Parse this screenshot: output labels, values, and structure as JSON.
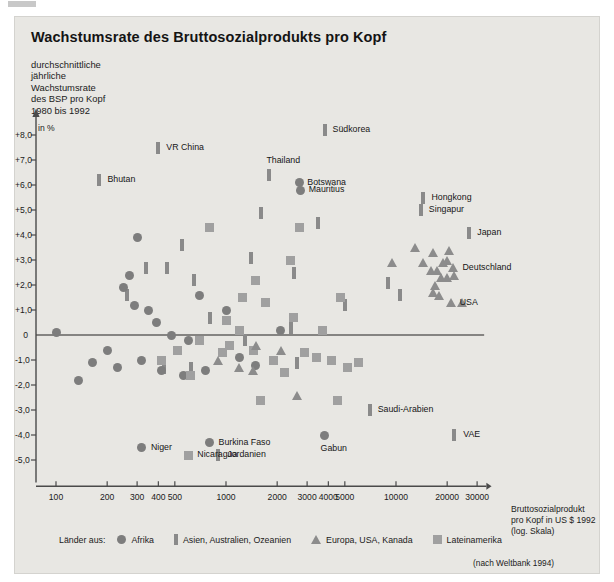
{
  "header": {
    "title": "Wachstumsrate des Bruttosozialprodukts pro Kopf",
    "subtitle": "durchschnittliche\njährliche\nWachstumsrate\ndes BSP pro Kopf\n1980 bis 1992"
  },
  "source_note": "(nach Weltbank 1994)",
  "legend": {
    "title": "Länder aus:",
    "items": [
      {
        "marker": "circle",
        "label": "Afrika",
        "color": "#7d7d7d"
      },
      {
        "marker": "bar",
        "label": "Asien, Australien, Ozeanien",
        "color": "#8a8a8a"
      },
      {
        "marker": "triangle",
        "label": "Europa, USA, Kanada",
        "color": "#8c8c8c"
      },
      {
        "marker": "square",
        "label": "Lateinamerika",
        "color": "#a0a0a0"
      }
    ]
  },
  "chart_data": {
    "type": "scatter",
    "title": "Wachstumsrate des Bruttosozialprodukts pro Kopf",
    "xlabel": "Bruttosozialprodukt\npro Kopf in US $ 1992\n(log. Skala)",
    "ylabel": "in %",
    "xscale": "log",
    "xlim": [
      90,
      40000
    ],
    "ylim": [
      -5.6,
      8.6
    ],
    "grid": false,
    "legend_position": "bottom",
    "zero_line": true,
    "xticks": [
      100,
      200,
      300,
      400,
      500,
      1000,
      2000,
      3000,
      4000,
      5000,
      10000,
      20000,
      30000
    ],
    "xticklabels": [
      "100",
      "200",
      "300",
      "400",
      "500",
      "1000",
      "2000",
      "3000",
      "4000",
      "5000",
      "10000",
      "20000",
      "30000"
    ],
    "yticks": [
      8,
      7,
      6,
      5,
      4,
      3,
      2,
      1,
      0,
      -1,
      -2,
      -3,
      -4,
      -5
    ],
    "yticklabels": [
      "+8,0",
      "+7,0",
      "+6,0",
      "+5,0",
      "+4,0",
      "+3,0",
      "+2,0",
      "+1,0",
      "0",
      "-1,0",
      "-2,0",
      "-3,0",
      "-4,0",
      "-5,0"
    ],
    "series": [
      {
        "name": "Asien, Australien, Ozeanien",
        "marker": "bar",
        "color": "#8a8a8a",
        "points": [
          {
            "x": 3800,
            "y": 8.2,
            "label": "Südkorea"
          },
          {
            "x": 400,
            "y": 7.5,
            "label": "VR China"
          },
          {
            "x": 1800,
            "y": 6.4,
            "label": "Thailand"
          },
          {
            "x": 180,
            "y": 6.2,
            "label": "Bhutan"
          },
          {
            "x": 14500,
            "y": 5.5,
            "label": "Hongkong"
          },
          {
            "x": 14000,
            "y": 5.0,
            "label": "Singapur"
          },
          {
            "x": 27000,
            "y": 4.1,
            "label": "Japan"
          },
          {
            "x": 1600,
            "y": 4.9
          },
          {
            "x": 3500,
            "y": 4.5
          },
          {
            "x": 550,
            "y": 3.6
          },
          {
            "x": 340,
            "y": 2.7
          },
          {
            "x": 450,
            "y": 2.7
          },
          {
            "x": 1400,
            "y": 3.1
          },
          {
            "x": 650,
            "y": 2.2
          },
          {
            "x": 2500,
            "y": 2.5
          },
          {
            "x": 260,
            "y": 1.6
          },
          {
            "x": 800,
            "y": 0.7
          },
          {
            "x": 5000,
            "y": 1.2
          },
          {
            "x": 9000,
            "y": 2.1
          },
          {
            "x": 10500,
            "y": 1.6
          },
          {
            "x": 2400,
            "y": 0.3
          },
          {
            "x": 1300,
            "y": -0.2
          },
          {
            "x": 430,
            "y": -1.3
          },
          {
            "x": 620,
            "y": -1.3
          },
          {
            "x": 2600,
            "y": -1.1
          },
          {
            "x": 900,
            "y": -4.8,
            "label": "Jordanien"
          },
          {
            "x": 7000,
            "y": -3.0,
            "label": "Saudi-Arabien"
          },
          {
            "x": 22000,
            "y": -4.0,
            "label": "VAE"
          }
        ]
      },
      {
        "name": "Afrika",
        "marker": "circle",
        "color": "#7d7d7d",
        "points": [
          {
            "x": 2700,
            "y": 6.1,
            "label": "Botswana"
          },
          {
            "x": 2750,
            "y": 5.8,
            "label": "Mauritius"
          },
          {
            "x": 300,
            "y": 3.9
          },
          {
            "x": 270,
            "y": 2.4
          },
          {
            "x": 250,
            "y": 1.9
          },
          {
            "x": 290,
            "y": 1.2
          },
          {
            "x": 700,
            "y": 1.6
          },
          {
            "x": 1000,
            "y": 1.0
          },
          {
            "x": 350,
            "y": 1.0
          },
          {
            "x": 100,
            "y": 0.1
          },
          {
            "x": 390,
            "y": 0.5
          },
          {
            "x": 480,
            "y": 0.0
          },
          {
            "x": 600,
            "y": -0.2
          },
          {
            "x": 200,
            "y": -0.6
          },
          {
            "x": 230,
            "y": -1.3
          },
          {
            "x": 165,
            "y": -1.1
          },
          {
            "x": 135,
            "y": -1.8
          },
          {
            "x": 320,
            "y": -1.0
          },
          {
            "x": 420,
            "y": -1.4
          },
          {
            "x": 560,
            "y": -1.6
          },
          {
            "x": 760,
            "y": -1.4
          },
          {
            "x": 1200,
            "y": -0.9
          },
          {
            "x": 1500,
            "y": -1.2
          },
          {
            "x": 2100,
            "y": 0.2
          },
          {
            "x": 320,
            "y": -4.5,
            "label": "Niger"
          },
          {
            "x": 800,
            "y": -4.3,
            "label": "Burkina Faso"
          },
          {
            "x": 3800,
            "y": -4.0,
            "label": "Gabun"
          }
        ]
      },
      {
        "name": "Lateinamerika",
        "marker": "square",
        "color": "#a0a0a0",
        "points": [
          {
            "x": 800,
            "y": 4.3
          },
          {
            "x": 2700,
            "y": 4.3
          },
          {
            "x": 2400,
            "y": 3.0
          },
          {
            "x": 1500,
            "y": 2.2
          },
          {
            "x": 1250,
            "y": 1.5
          },
          {
            "x": 1700,
            "y": 1.3
          },
          {
            "x": 1000,
            "y": 0.6
          },
          {
            "x": 2500,
            "y": 0.7
          },
          {
            "x": 1200,
            "y": 0.2
          },
          {
            "x": 4700,
            "y": 1.5
          },
          {
            "x": 3700,
            "y": 0.2
          },
          {
            "x": 700,
            "y": -0.2
          },
          {
            "x": 1050,
            "y": -0.4
          },
          {
            "x": 950,
            "y": -0.7
          },
          {
            "x": 1450,
            "y": -0.6
          },
          {
            "x": 2900,
            "y": -0.7
          },
          {
            "x": 3400,
            "y": -0.9
          },
          {
            "x": 4200,
            "y": -1.0
          },
          {
            "x": 5200,
            "y": -1.3
          },
          {
            "x": 6000,
            "y": -1.1
          },
          {
            "x": 520,
            "y": -0.6
          },
          {
            "x": 420,
            "y": -1.0
          },
          {
            "x": 620,
            "y": -1.6
          },
          {
            "x": 1900,
            "y": -1.0
          },
          {
            "x": 2200,
            "y": -1.5
          },
          {
            "x": 1600,
            "y": -2.6
          },
          {
            "x": 4500,
            "y": -2.6
          },
          {
            "x": 600,
            "y": -4.8,
            "label": "Nicaragua"
          }
        ]
      },
      {
        "name": "Europa, USA, Kanada",
        "marker": "triangle",
        "color": "#8c8c8c",
        "points": [
          {
            "x": 13000,
            "y": 3.5
          },
          {
            "x": 16500,
            "y": 3.3
          },
          {
            "x": 14500,
            "y": 2.9
          },
          {
            "x": 20500,
            "y": 3.4
          },
          {
            "x": 20000,
            "y": 3.0
          },
          {
            "x": 19000,
            "y": 2.9
          },
          {
            "x": 16000,
            "y": 2.6
          },
          {
            "x": 17500,
            "y": 2.6
          },
          {
            "x": 21500,
            "y": 2.7,
            "label": "Deutschland"
          },
          {
            "x": 18500,
            "y": 2.3
          },
          {
            "x": 20000,
            "y": 2.3
          },
          {
            "x": 22000,
            "y": 2.4
          },
          {
            "x": 17000,
            "y": 2.0
          },
          {
            "x": 16500,
            "y": 1.7
          },
          {
            "x": 18000,
            "y": 1.6
          },
          {
            "x": 21000,
            "y": 1.3,
            "label": "USA"
          },
          {
            "x": 24500,
            "y": 1.3
          },
          {
            "x": 9500,
            "y": 2.9
          },
          {
            "x": 1500,
            "y": -0.4
          },
          {
            "x": 2100,
            "y": -0.6
          },
          {
            "x": 1200,
            "y": -1.3
          },
          {
            "x": 1450,
            "y": -1.4
          },
          {
            "x": 2600,
            "y": -2.4
          },
          {
            "x": 900,
            "y": -1.0
          }
        ]
      }
    ],
    "annotations": [
      {
        "text": "Südkorea",
        "x": 3800,
        "y": 8.2
      },
      {
        "text": "VR China",
        "x": 400,
        "y": 7.5
      },
      {
        "text": "Thailand",
        "x": 1800,
        "y": 6.4
      },
      {
        "text": "Botswana",
        "x": 2700,
        "y": 6.1
      },
      {
        "text": "Mauritius",
        "x": 2750,
        "y": 5.8
      },
      {
        "text": "Bhutan",
        "x": 180,
        "y": 6.2
      },
      {
        "text": "Hongkong",
        "x": 14500,
        "y": 5.5
      },
      {
        "text": "Singapur",
        "x": 14000,
        "y": 5.0
      },
      {
        "text": "Japan",
        "x": 27000,
        "y": 4.1
      },
      {
        "text": "Deutschland",
        "x": 21500,
        "y": 2.7
      },
      {
        "text": "USA",
        "x": 21000,
        "y": 1.3
      },
      {
        "text": "Saudi-Arabien",
        "x": 7000,
        "y": -3.0
      },
      {
        "text": "VAE",
        "x": 22000,
        "y": -4.0
      },
      {
        "text": "Gabun",
        "x": 3800,
        "y": -4.0
      },
      {
        "text": "Niger",
        "x": 320,
        "y": -4.5
      },
      {
        "text": "Burkina Faso",
        "x": 800,
        "y": -4.3
      },
      {
        "text": "Nicaragua",
        "x": 600,
        "y": -4.8
      },
      {
        "text": "Jordanien",
        "x": 900,
        "y": -4.8
      }
    ]
  }
}
